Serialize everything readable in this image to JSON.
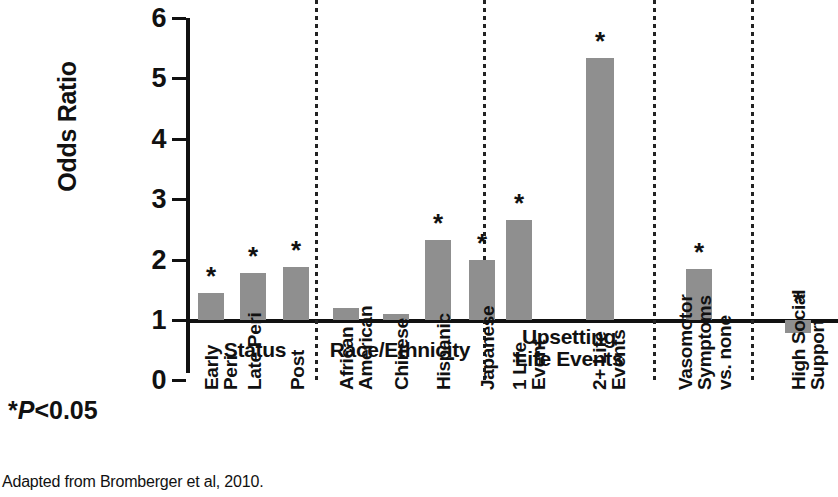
{
  "chart_data": {
    "type": "bar",
    "title": "",
    "xlabel": "",
    "ylabel": "Odds Ratio",
    "ylim": [
      0,
      6
    ],
    "yticks": [
      0,
      1,
      2,
      3,
      4,
      5,
      6
    ],
    "ytick_labels": [
      "0",
      "1",
      "2",
      "3",
      "4",
      "5",
      "6"
    ],
    "grid": false,
    "legend": "none",
    "reference_line": 1,
    "bar_color": "#8f8f8f",
    "axis_color": "#111111",
    "significance_marker": "*",
    "groups": [
      {
        "name": "Status",
        "categories": [
          "Early\nPeri",
          "Late Peri",
          "Post"
        ],
        "values": [
          1.44,
          1.77,
          1.88
        ],
        "significant": [
          true,
          true,
          true
        ]
      },
      {
        "name": "Race/Ethnicity",
        "categories": [
          "African\nAmerican",
          "Chinese",
          "Hispanic",
          "Japanese"
        ],
        "values": [
          1.2,
          1.1,
          2.32,
          2.0
        ],
        "significant": [
          false,
          false,
          true,
          true
        ]
      },
      {
        "name": "Upsetting\nLife Events",
        "categories": [
          "1 Life\nEvent",
          "2+ Life\nEvents"
        ],
        "values": [
          2.66,
          5.34
        ],
        "significant": [
          true,
          true
        ]
      },
      {
        "name": "",
        "categories": [
          "Vasomotor\nSymptoms\nvs. none"
        ],
        "values": [
          1.85
        ],
        "significant": [
          true
        ]
      },
      {
        "name": "",
        "categories": [
          "High Social\nSupport"
        ],
        "values": [
          0.78
        ],
        "significant": [
          true
        ]
      }
    ]
  },
  "axis": {
    "y_title": "Odds Ratio",
    "ticks": [
      {
        "label": "6",
        "value": 6
      },
      {
        "label": "5",
        "value": 5
      },
      {
        "label": "4",
        "value": 4
      },
      {
        "label": "3",
        "value": 3
      },
      {
        "label": "2",
        "value": 2
      },
      {
        "label": "1",
        "value": 1
      },
      {
        "label": "0",
        "value": 0
      }
    ]
  },
  "group_titles": [
    {
      "text": "Status",
      "left": 196,
      "top": 339,
      "width": 118
    },
    {
      "text": "Race/Ethnicity",
      "left": 318,
      "top": 339,
      "width": 164
    },
    {
      "text": "Upsetting\nLife Events",
      "left": 487,
      "top": 326,
      "width": 164
    },
    {
      "text": "",
      "left": 656,
      "top": 339,
      "width": 92
    },
    {
      "text": "",
      "left": 754,
      "top": 339,
      "width": 84
    }
  ],
  "bars": [
    {
      "label": "Early\nPeri",
      "value": 1.44,
      "star": true,
      "left": 198,
      "width": 26,
      "label_left": 202,
      "label_top": 390
    },
    {
      "label": "Late Peri",
      "value": 1.77,
      "star": true,
      "left": 240,
      "width": 26,
      "label_left": 245,
      "label_top": 390
    },
    {
      "label": "Post",
      "value": 1.88,
      "star": true,
      "left": 283,
      "width": 26,
      "label_left": 288,
      "label_top": 390
    },
    {
      "label": "African\nAmerican",
      "value": 1.2,
      "star": false,
      "left": 333,
      "width": 26,
      "label_left": 337,
      "label_top": 390
    },
    {
      "label": "Chinese",
      "value": 1.1,
      "star": false,
      "left": 383,
      "width": 26,
      "label_left": 392,
      "label_top": 390
    },
    {
      "label": "Hispanic",
      "value": 2.32,
      "star": true,
      "left": 425,
      "width": 26,
      "label_left": 434,
      "label_top": 390
    },
    {
      "label": "Japanese",
      "value": 2.0,
      "star": true,
      "left": 469,
      "width": 26,
      "label_left": 478,
      "label_top": 390
    },
    {
      "label": "1 Life\nEvent",
      "value": 2.66,
      "star": true,
      "left": 506,
      "width": 26,
      "label_left": 510,
      "label_top": 390
    },
    {
      "label": "2+ Life\nEvents",
      "value": 5.34,
      "star": true,
      "left": 586,
      "width": 28,
      "label_left": 590,
      "label_top": 390
    },
    {
      "label": "Vasomotor\nSymptoms\nvs. none",
      "value": 1.85,
      "star": true,
      "left": 686,
      "width": 26,
      "label_left": 676,
      "label_top": 390
    },
    {
      "label": "High Social\nSupport",
      "value": 0.78,
      "star": true,
      "left": 785,
      "width": 26,
      "label_left": 789,
      "label_top": 390
    }
  ],
  "dividers": [
    315,
    483,
    653,
    751
  ],
  "notes": {
    "pvalue_prefix": "*",
    "pvalue_italic": "P",
    "pvalue_suffix": "<0.05",
    "source": "Adapted from Bromberger et al, 2010."
  }
}
